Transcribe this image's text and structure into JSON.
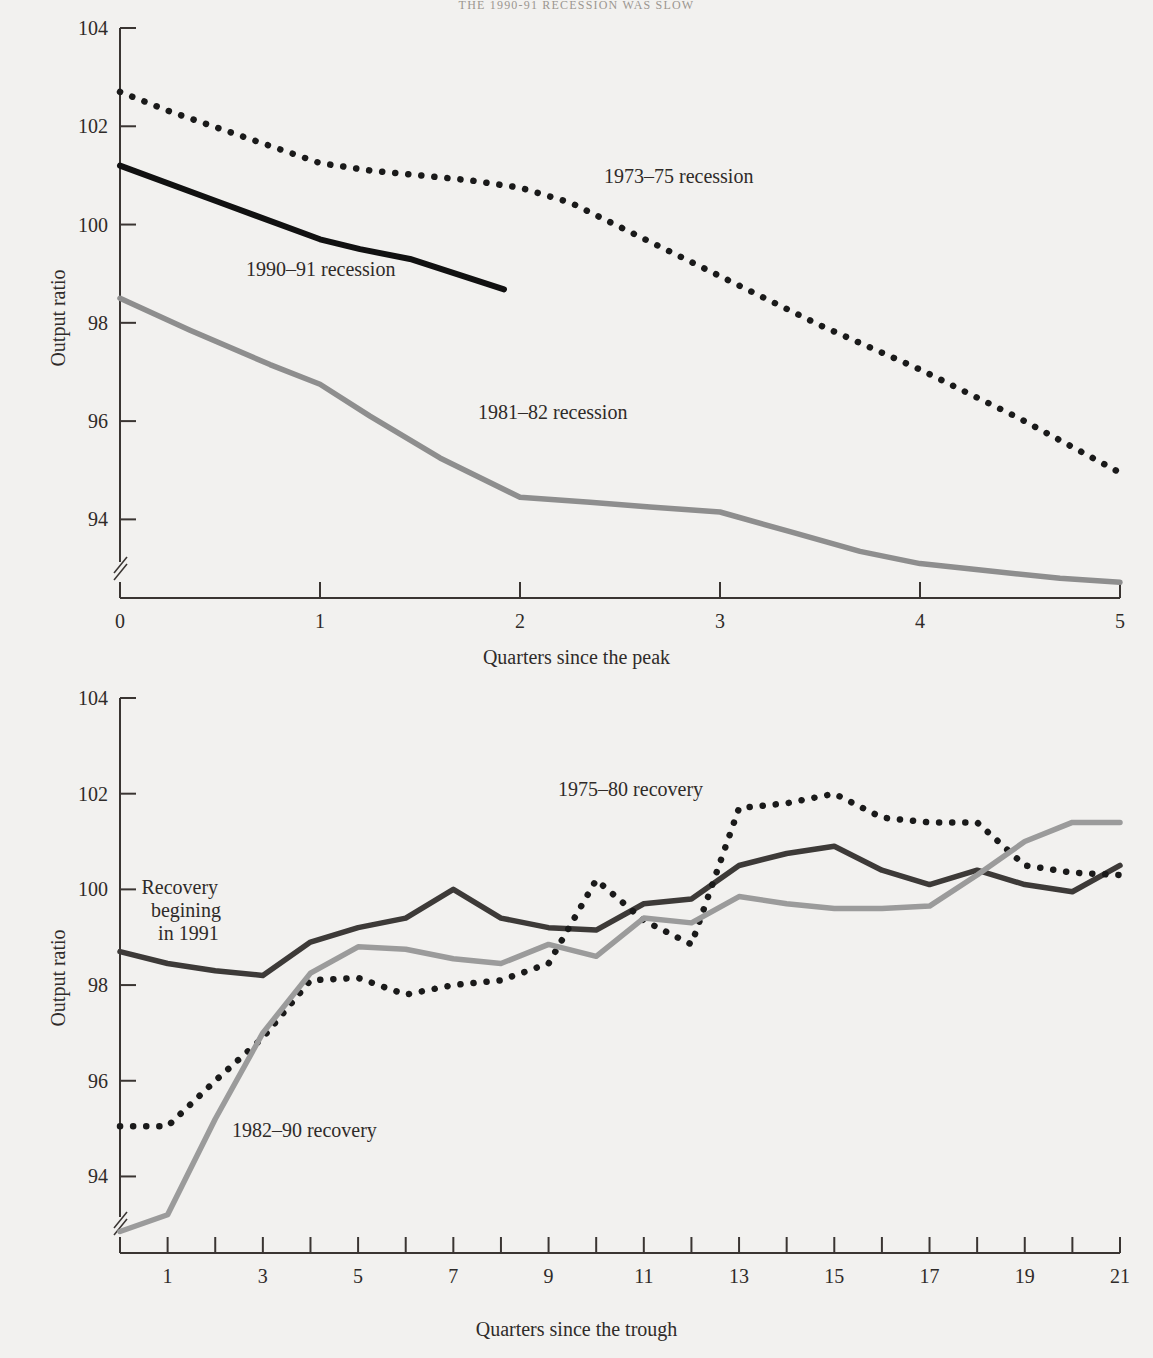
{
  "running_head": "THE 1990-91 RECESSION WAS SLOW",
  "colors": {
    "page_bg": "#f2f1ef",
    "axis": "#3a3532",
    "text": "#2f2b29",
    "series_black": "#111111",
    "series_dark": "#3d3a38",
    "series_gray": "#8e8e8e",
    "series_dotted": "#1a1a1a"
  },
  "charts": [
    {
      "id": "recessions",
      "ylabel": "Output ratio",
      "xlabel": "Quarters since the peak",
      "yticks": [
        104,
        102,
        100,
        98,
        96,
        94
      ],
      "xticks": [
        0,
        1,
        2,
        3,
        4,
        5
      ],
      "ylim": [
        92.4,
        104
      ],
      "xlim": [
        0,
        5
      ],
      "axis_break": true,
      "annotations": [
        {
          "text": "1973–75 recession",
          "x": 2.42,
          "y": 100.95
        },
        {
          "text": "1990–91 recession",
          "x": 0.63,
          "y": 99.05
        },
        {
          "text": "1981–82 recession",
          "x": 1.79,
          "y": 96.15
        }
      ]
    },
    {
      "id": "recoveries",
      "ylabel": "Output ratio",
      "xlabel": "Quarters since the trough",
      "yticks": [
        104,
        102,
        100,
        98,
        96,
        94
      ],
      "xticks": [
        1,
        3,
        5,
        7,
        9,
        11,
        13,
        15,
        17,
        19,
        21
      ],
      "minor_xticks": [
        2,
        4,
        6,
        8,
        10,
        12,
        14,
        16,
        18,
        20
      ],
      "ylim": [
        92.4,
        104
      ],
      "xlim": [
        0,
        21
      ],
      "axis_break": true,
      "annotations": [
        {
          "text": "1975–80 recovery",
          "x": 9.2,
          "y": 102.05
        },
        {
          "text": "Recovery",
          "x": 0.45,
          "y": 100.0
        },
        {
          "text": "begining",
          "x": 0.65,
          "y": 99.52
        },
        {
          "text": "in 1991",
          "x": 0.8,
          "y": 99.04
        },
        {
          "text": "1982–90 recovery",
          "x": 2.35,
          "y": 94.92
        }
      ]
    }
  ],
  "chart_data": [
    {
      "type": "line",
      "title": "",
      "xlabel": "Quarters since the peak",
      "ylabel": "Output ratio",
      "xlim": [
        0,
        5
      ],
      "ylim": [
        92.4,
        104
      ],
      "xticks": [
        0,
        1,
        2,
        3,
        4,
        5
      ],
      "yticks": [
        104,
        102,
        100,
        98,
        96,
        94
      ],
      "grid": false,
      "legend": "inline-annotations",
      "series": [
        {
          "name": "1973–75 recession",
          "style": "dotted",
          "color": "#1a1a1a",
          "x": [
            0.0,
            0.25,
            0.5,
            0.75,
            1.0,
            1.25,
            1.5,
            1.75,
            2.0,
            2.25,
            2.5,
            2.75,
            3.0,
            3.25,
            3.5,
            3.75,
            4.0,
            4.25,
            4.5,
            4.75,
            5.0
          ],
          "y": [
            102.7,
            102.3,
            101.95,
            101.6,
            101.25,
            101.1,
            101.0,
            100.9,
            100.75,
            100.45,
            99.95,
            99.45,
            98.95,
            98.45,
            97.95,
            97.5,
            97.05,
            96.55,
            96.05,
            95.5,
            94.95
          ]
        },
        {
          "name": "1990–91 recession",
          "style": "solid",
          "color": "#111111",
          "x": [
            0.0,
            0.5,
            1.0,
            1.2,
            1.45,
            1.92
          ],
          "y": [
            101.2,
            100.45,
            99.7,
            99.5,
            99.3,
            98.68
          ]
        },
        {
          "name": "1981–82 recession",
          "style": "solid",
          "color": "#8e8e8e",
          "x": [
            0.0,
            0.35,
            0.75,
            1.0,
            1.25,
            1.6,
            2.0,
            2.35,
            2.65,
            3.0,
            3.35,
            3.7,
            4.0,
            4.35,
            4.7,
            5.0
          ],
          "y": [
            98.5,
            97.85,
            97.15,
            96.75,
            96.1,
            95.25,
            94.45,
            94.35,
            94.25,
            94.15,
            93.75,
            93.35,
            93.1,
            92.95,
            92.8,
            92.72
          ]
        }
      ]
    },
    {
      "type": "line",
      "title": "",
      "xlabel": "Quarters since the trough",
      "ylabel": "Output ratio",
      "xlim": [
        0,
        21
      ],
      "ylim": [
        92.4,
        104
      ],
      "xticks": [
        1,
        3,
        5,
        7,
        9,
        11,
        13,
        15,
        17,
        19,
        21
      ],
      "yticks": [
        104,
        102,
        100,
        98,
        96,
        94
      ],
      "grid": false,
      "legend": "inline-annotations",
      "series": [
        {
          "name": "Recovery begining in 1991",
          "style": "solid",
          "color": "#3d3a38",
          "x": [
            0,
            1,
            2,
            3,
            4,
            5,
            6,
            7,
            8,
            9,
            10,
            11,
            12,
            13,
            14,
            15,
            16,
            17,
            18,
            19,
            20,
            21
          ],
          "y": [
            98.7,
            98.45,
            98.3,
            98.2,
            98.9,
            99.2,
            99.4,
            100.0,
            99.4,
            99.2,
            99.15,
            99.7,
            99.8,
            100.5,
            100.75,
            100.9,
            100.4,
            100.1,
            100.4,
            100.1,
            99.95,
            100.5
          ]
        },
        {
          "name": "1975–80 recovery",
          "style": "dotted",
          "color": "#1a1a1a",
          "x": [
            0,
            1,
            2,
            3,
            4,
            5,
            6,
            7,
            8,
            9,
            10,
            11,
            12,
            13,
            14,
            15,
            16,
            17,
            18,
            19,
            20,
            21
          ],
          "y": [
            95.05,
            95.05,
            96.0,
            96.9,
            98.1,
            98.15,
            97.8,
            98.0,
            98.1,
            98.45,
            100.2,
            99.35,
            98.85,
            101.7,
            101.8,
            102.0,
            101.5,
            101.4,
            101.4,
            100.5,
            100.35,
            100.3
          ]
        },
        {
          "name": "1982–90 recovery",
          "style": "solid",
          "color": "#9b9b9b",
          "x": [
            0,
            1,
            2,
            3,
            4,
            5,
            6,
            7,
            8,
            9,
            10,
            11,
            12,
            13,
            14,
            15,
            16,
            17,
            18,
            19,
            20,
            21
          ],
          "y": [
            92.85,
            93.2,
            95.2,
            97.0,
            98.25,
            98.8,
            98.75,
            98.55,
            98.45,
            98.85,
            98.6,
            99.4,
            99.3,
            99.85,
            99.7,
            99.6,
            99.6,
            99.65,
            100.3,
            101.0,
            101.4,
            101.4
          ]
        }
      ]
    }
  ]
}
